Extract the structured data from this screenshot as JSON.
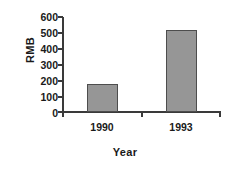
{
  "chart_data": {
    "type": "bar",
    "title": "",
    "categories": [
      "1990",
      "1993"
    ],
    "values": [
      180,
      520
    ],
    "series": [
      {
        "name": "RMB",
        "values": [
          180,
          520
        ]
      }
    ],
    "xlabel": "Year",
    "ylabel": "RMB",
    "ylim": [
      0,
      600
    ],
    "yticks": [
      0,
      100,
      200,
      300,
      400,
      500,
      600
    ],
    "ytick_labels": [
      "0",
      "100",
      "200",
      "300",
      "400",
      "500",
      "600"
    ],
    "grid": false,
    "legend": false,
    "bar_color": "#969696",
    "bar_edge_color": "#4d4d4d",
    "axis_color": "#3a3a3a",
    "background": "#ffffff"
  }
}
